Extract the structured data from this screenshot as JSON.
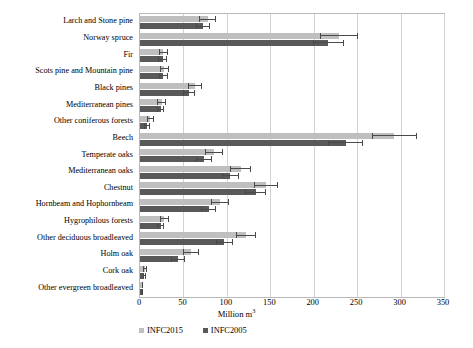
{
  "chart_data": {
    "type": "bar",
    "orientation": "horizontal",
    "title": "",
    "xlabel": "Million m³",
    "ylabel": "",
    "xlim": [
      0,
      350
    ],
    "xticks": [
      0,
      50,
      100,
      150,
      200,
      250,
      300,
      350
    ],
    "grid": true,
    "legend_position": "bottom-left",
    "categories": [
      "Larch and Stone pine",
      "Norway spruce",
      "Fir",
      "Scots pine and Mountain pine",
      "Black pines",
      "Mediterranean pines",
      "Other coniferous forests",
      "Beech",
      "Temperate oaks",
      "Mediterranean oaks",
      "Chestnut",
      "Hornbeam and Hophornbeam",
      "Hygrophilous forests",
      "Other deciduous broadleaved",
      "Holm oak",
      "Cork oak",
      "Other evergreen broadleaved"
    ],
    "series": [
      {
        "name": "INFC2015",
        "color": "#bfbfbf",
        "values": [
          78,
          229,
          27,
          28,
          63,
          25,
          12,
          293,
          85,
          116,
          145,
          92,
          28,
          122,
          59,
          6,
          3
        ],
        "errors": [
          10,
          22,
          5,
          5,
          8,
          5,
          4,
          26,
          10,
          12,
          14,
          10,
          5,
          12,
          9,
          2,
          1
        ]
      },
      {
        "name": "INFC2005",
        "color": "#595959",
        "values": [
          73,
          217,
          26,
          27,
          56,
          24,
          8,
          237,
          74,
          104,
          133,
          79,
          24,
          97,
          44,
          5,
          2
        ],
        "errors": [
          8,
          18,
          5,
          5,
          7,
          4,
          3,
          20,
          9,
          10,
          12,
          9,
          4,
          10,
          8,
          2,
          1
        ]
      }
    ]
  },
  "legend": {
    "items": [
      {
        "label": "INFC2015",
        "color": "#bfbfbf"
      },
      {
        "label": "INFC2005",
        "color": "#595959"
      }
    ]
  },
  "axis": {
    "x_title_text": "Million m",
    "x_title_exponent": "3",
    "tick_labels": [
      "0",
      "50",
      "100",
      "150",
      "200",
      "250",
      "300",
      "350"
    ]
  }
}
